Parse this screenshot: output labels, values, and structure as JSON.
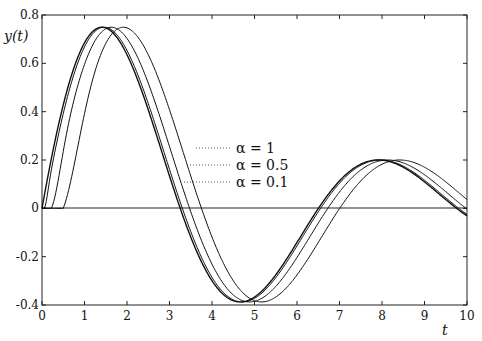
{
  "chart_data": {
    "type": "line",
    "title": "",
    "xlabel": "t",
    "ylabel": "y(t)",
    "xlim": [
      0,
      10
    ],
    "ylim": [
      -0.4,
      0.8
    ],
    "xticks": [
      "0",
      "1",
      "2",
      "3",
      "4",
      "5",
      "6",
      "7",
      "8",
      "9",
      "10"
    ],
    "yticks": [
      "-0.4",
      "-0.2",
      "0",
      "0.2",
      "0.4",
      "0.6",
      "0.8"
    ],
    "grid": false,
    "legend_position": "inline-center",
    "legend": [
      "α = 1",
      "α = 0.5",
      "α = 0.1"
    ],
    "series": [
      {
        "name": "α = 1 (a)",
        "delay": 0.0,
        "ramp": 0.0
      },
      {
        "name": "α = 1 (b)",
        "delay": 0.05,
        "ramp": 0.15
      },
      {
        "name": "α = 0.5",
        "delay": 0.22,
        "ramp": 0.45
      },
      {
        "name": "α = 0.1",
        "delay": 0.5,
        "ramp": 0.9
      }
    ],
    "annotations": {
      "peak_1": {
        "t": 1.45,
        "y": 0.75
      },
      "trough": {
        "t": 4.7,
        "y": -0.4
      },
      "peak_2": {
        "t": 7.9,
        "y": 0.2
      }
    }
  },
  "axes": {
    "xlabel": "t",
    "ylabel": "y(t)"
  },
  "legend": {
    "items": [
      "α = 1",
      "α = 0.5",
      "α = 0.1"
    ]
  }
}
